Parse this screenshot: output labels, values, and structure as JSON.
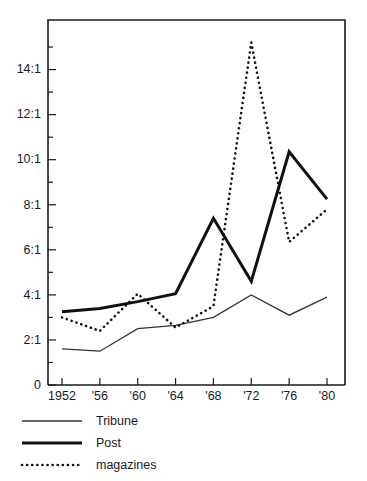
{
  "chart_data": {
    "type": "line",
    "title": "",
    "subtitle": "",
    "xlabel": "",
    "ylabel": "",
    "x": [
      1952,
      1956,
      1960,
      1964,
      1968,
      1972,
      1976,
      1980
    ],
    "categories": [
      "1952",
      "'56",
      "'60",
      "'64",
      "'68",
      "'72",
      "'76",
      "'80"
    ],
    "xtick_labels": [
      "1952",
      "'56",
      "'60",
      "'64",
      "'68",
      "'72",
      "'76",
      "'80"
    ],
    "ytick_labels": [
      "0",
      "2:1",
      "4:1",
      "6:1",
      "8:1",
      "10:1",
      "12:1",
      "14:1"
    ],
    "ytick_values": [
      0,
      2,
      4,
      6,
      8,
      10,
      12,
      14
    ],
    "yminor_step": 1,
    "ylim": [
      0,
      16.2
    ],
    "xlim": [
      1950.6,
      1981.8
    ],
    "grid": false,
    "legend_position": "below-axes-left",
    "series": [
      {
        "name": "Tribune",
        "style": "thin-solid",
        "color": "#333333",
        "values": [
          1.6,
          1.5,
          2.5,
          2.65,
          3.0,
          4.0,
          3.1,
          3.9
        ]
      },
      {
        "name": "Post",
        "style": "thick-solid",
        "color": "#111111",
        "values": [
          3.25,
          3.4,
          3.7,
          4.05,
          7.4,
          4.6,
          10.35,
          8.25
        ]
      },
      {
        "name": "magazines",
        "style": "dotted",
        "color": "#111111",
        "values": [
          3.0,
          2.4,
          4.05,
          2.55,
          3.5,
          15.2,
          6.35,
          7.8
        ]
      }
    ]
  },
  "legend": {
    "items": [
      {
        "label": "Tribune",
        "style": "thin-solid"
      },
      {
        "label": "Post",
        "style": "thick-solid"
      },
      {
        "label": "magazines",
        "style": "dotted"
      }
    ]
  },
  "colors": {
    "background": "#ffffff",
    "axis": "#1a1a1a",
    "text": "#1a1a1a",
    "tribune": "#333333",
    "post": "#111111",
    "magazines": "#111111"
  }
}
